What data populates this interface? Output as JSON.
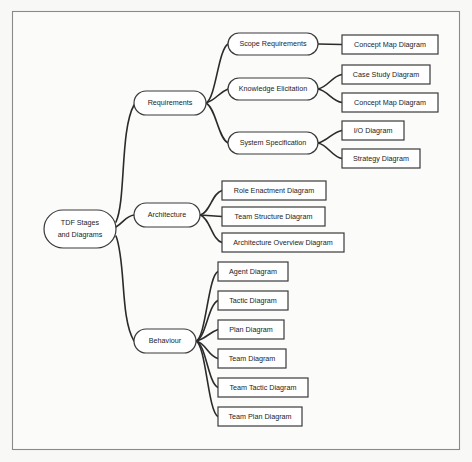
{
  "diagram": {
    "title": "TDF Stages and Diagrams",
    "type": "mind-map",
    "canvas": {
      "width": 472,
      "height": 462
    },
    "frame": {
      "x": 12,
      "y": 11,
      "width": 448,
      "height": 439,
      "stroke": "#8a8a8a",
      "fill": "#fbfbfa"
    },
    "colors": {
      "background": "#f8f8f6",
      "node_fill": "#ffffff",
      "node_stroke": "#3a3a3a",
      "connector": "#2b2b2b",
      "text": "#1c1c1c"
    },
    "root": {
      "id": "root",
      "label_line1": "TDF Stages",
      "label_line2": "and Diagrams",
      "shape": "rounded-rect",
      "x": 44,
      "y": 210,
      "width": 72,
      "height": 38
    },
    "branches": [
      {
        "id": "requirements",
        "label": "Requirements",
        "shape": "rounded-rect",
        "x": 134,
        "y": 91,
        "width": 72,
        "height": 24,
        "children": [
          {
            "id": "scope-requirements",
            "label": "Scope Requirements",
            "shape": "rounded-rect",
            "x": 228,
            "y": 33,
            "width": 90,
            "height": 22,
            "leaves": [
              {
                "id": "concept-map-diagram-1",
                "label": "Concept Map Diagram",
                "x": 342,
                "y": 35,
                "width": 96,
                "height": 19
              }
            ]
          },
          {
            "id": "knowledge-elicitation",
            "label": "Knowledge Elicitation",
            "shape": "rounded-rect",
            "x": 228,
            "y": 78,
            "width": 90,
            "height": 22,
            "leaves": [
              {
                "id": "case-study-diagram",
                "label": "Case Study Diagram",
                "x": 342,
                "y": 65,
                "width": 88,
                "height": 19
              },
              {
                "id": "concept-map-diagram-2",
                "label": "Concept Map Diagram",
                "x": 342,
                "y": 93,
                "width": 96,
                "height": 19
              }
            ]
          },
          {
            "id": "system-specification",
            "label": "System Specification",
            "shape": "rounded-rect",
            "x": 228,
            "y": 132,
            "width": 90,
            "height": 22,
            "leaves": [
              {
                "id": "io-diagram",
                "label": "I/O Diagram",
                "x": 342,
                "y": 121,
                "width": 62,
                "height": 19
              },
              {
                "id": "strategy-diagram",
                "label": "Strategy Diagram",
                "x": 342,
                "y": 149,
                "width": 78,
                "height": 19
              }
            ]
          }
        ]
      },
      {
        "id": "architecture",
        "label": "Architecture",
        "shape": "rounded-rect",
        "x": 134,
        "y": 203,
        "width": 66,
        "height": 24,
        "children": [],
        "leaves": [
          {
            "id": "role-enactment-diagram",
            "label": "Role Enactment Diagram",
            "x": 222,
            "y": 181,
            "width": 104,
            "height": 19
          },
          {
            "id": "team-structure-diagram",
            "label": "Team Structure Diagram",
            "x": 222,
            "y": 207,
            "width": 103,
            "height": 19
          },
          {
            "id": "architecture-overview-diagram",
            "label": "Architecture Overview Diagram",
            "x": 222,
            "y": 233,
            "width": 122,
            "height": 19
          }
        ]
      },
      {
        "id": "behaviour",
        "label": "Behaviour",
        "shape": "rounded-rect",
        "x": 134,
        "y": 329,
        "width": 62,
        "height": 24,
        "children": [],
        "leaves": [
          {
            "id": "agent-diagram",
            "label": "Agent Diagram",
            "x": 218,
            "y": 262,
            "width": 70,
            "height": 19
          },
          {
            "id": "tactic-diagram",
            "label": "Tactic Diagram",
            "x": 218,
            "y": 291,
            "width": 70,
            "height": 19
          },
          {
            "id": "plan-diagram",
            "label": "Plan Diagram",
            "x": 218,
            "y": 320,
            "width": 66,
            "height": 19
          },
          {
            "id": "team-diagram",
            "label": "Team Diagram",
            "x": 218,
            "y": 349,
            "width": 68,
            "height": 19
          },
          {
            "id": "team-tactic-diagram",
            "label": "Team Tactic Diagram",
            "x": 218,
            "y": 378,
            "width": 90,
            "height": 19
          },
          {
            "id": "team-plan-diagram",
            "label": "Team Plan Diagram",
            "x": 218,
            "y": 407,
            "width": 84,
            "height": 19
          }
        ]
      }
    ]
  }
}
